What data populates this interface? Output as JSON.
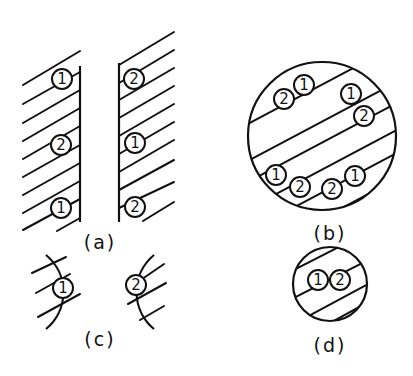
{
  "figure": {
    "panels": [
      {
        "id": "a",
        "label": "(a)",
        "description": "Two planar surfaces facing each other, hatched, with atoms labeled along each face"
      },
      {
        "id": "b",
        "label": "(b)",
        "description": "Large circular cross-section with parallel hatch planes and atoms at boundaries"
      },
      {
        "id": "c",
        "label": "(c)",
        "description": "Two opposing curved surfaces with single atoms"
      },
      {
        "id": "d",
        "label": "(d)",
        "description": "Small circular cross-section with an atom pair"
      }
    ],
    "atoms": {
      "a_left": [
        "1",
        "2",
        "1"
      ],
      "a_right": [
        "2",
        "1",
        "2"
      ],
      "b": [
        "2",
        "1",
        "1",
        "2",
        "1",
        "2",
        "2",
        "1"
      ],
      "c_left": "1",
      "c_right": "2",
      "d": [
        "1",
        "2"
      ]
    },
    "colors": {
      "ink": "#111111",
      "background": "#ffffff"
    }
  }
}
